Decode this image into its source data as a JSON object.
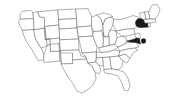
{
  "figure": {
    "width": 174,
    "height": 109,
    "background_color": "#ffffff",
    "outline_color": "#6e6e6e",
    "highlight_color": "#1a1a1a"
  },
  "chart_data": {
    "type": "map",
    "subtitle": "",
    "xlabel": "",
    "ylabel": "",
    "projection": "contiguous-48-states",
    "grid": false,
    "legend": "none",
    "base_fill": "#ffffff",
    "base_stroke": "#6e6e6e",
    "highlight_fill": "#1a1a1a",
    "regions": [
      {
        "code": "WA",
        "name": "Washington",
        "highlighted": false
      },
      {
        "code": "OR",
        "name": "Oregon",
        "highlighted": false
      },
      {
        "code": "CA",
        "name": "California",
        "highlighted": false
      },
      {
        "code": "NV",
        "name": "Nevada",
        "highlighted": false
      },
      {
        "code": "ID",
        "name": "Idaho",
        "highlighted": false
      },
      {
        "code": "MT",
        "name": "Montana",
        "highlighted": false
      },
      {
        "code": "WY",
        "name": "Wyoming",
        "highlighted": false
      },
      {
        "code": "UT",
        "name": "Utah",
        "highlighted": false
      },
      {
        "code": "AZ",
        "name": "Arizona",
        "highlighted": false
      },
      {
        "code": "CO",
        "name": "Colorado",
        "highlighted": false
      },
      {
        "code": "NM",
        "name": "New Mexico",
        "highlighted": false
      },
      {
        "code": "ND",
        "name": "North Dakota",
        "highlighted": false
      },
      {
        "code": "SD",
        "name": "South Dakota",
        "highlighted": false
      },
      {
        "code": "NE",
        "name": "Nebraska",
        "highlighted": false
      },
      {
        "code": "KS",
        "name": "Kansas",
        "highlighted": false
      },
      {
        "code": "OK",
        "name": "Oklahoma",
        "highlighted": false
      },
      {
        "code": "TX",
        "name": "Texas",
        "highlighted": false
      },
      {
        "code": "MN",
        "name": "Minnesota",
        "highlighted": false
      },
      {
        "code": "IA",
        "name": "Iowa",
        "highlighted": false
      },
      {
        "code": "MO",
        "name": "Missouri",
        "highlighted": false
      },
      {
        "code": "AR",
        "name": "Arkansas",
        "highlighted": false
      },
      {
        "code": "LA",
        "name": "Louisiana",
        "highlighted": false
      },
      {
        "code": "WI",
        "name": "Wisconsin",
        "highlighted": false
      },
      {
        "code": "IL",
        "name": "Illinois",
        "highlighted": false
      },
      {
        "code": "MI",
        "name": "Michigan",
        "highlighted": false
      },
      {
        "code": "IN",
        "name": "Indiana",
        "highlighted": false
      },
      {
        "code": "OH",
        "name": "Ohio",
        "highlighted": false
      },
      {
        "code": "KY",
        "name": "Kentucky",
        "highlighted": false
      },
      {
        "code": "TN",
        "name": "Tennessee",
        "highlighted": false
      },
      {
        "code": "MS",
        "name": "Mississippi",
        "highlighted": false
      },
      {
        "code": "AL",
        "name": "Alabama",
        "highlighted": false
      },
      {
        "code": "GA",
        "name": "Georgia",
        "highlighted": false
      },
      {
        "code": "FL",
        "name": "Florida",
        "highlighted": false
      },
      {
        "code": "SC",
        "name": "South Carolina",
        "highlighted": false
      },
      {
        "code": "NC",
        "name": "North Carolina",
        "highlighted": false
      },
      {
        "code": "VA",
        "name": "Virginia",
        "highlighted": false
      },
      {
        "code": "WV",
        "name": "West Virginia",
        "highlighted": false
      },
      {
        "code": "PA",
        "name": "Pennsylvania",
        "highlighted": false
      },
      {
        "code": "NY",
        "name": "New York",
        "highlighted": false
      },
      {
        "code": "VT",
        "name": "Vermont",
        "highlighted": false
      },
      {
        "code": "NH",
        "name": "New Hampshire",
        "highlighted": false
      },
      {
        "code": "ME",
        "name": "Maine",
        "highlighted": false
      },
      {
        "code": "MA",
        "name": "Massachusetts",
        "highlighted": false
      },
      {
        "code": "CT",
        "name": "Connecticut",
        "highlighted": true
      },
      {
        "code": "RI",
        "name": "Rhode Island",
        "highlighted": false
      },
      {
        "code": "NJ",
        "name": "New Jersey",
        "highlighted": false
      },
      {
        "code": "DE",
        "name": "Delaware",
        "highlighted": true
      },
      {
        "code": "MD",
        "name": "Maryland",
        "highlighted": true
      }
    ],
    "markers": [
      {
        "id": "marker-northeast",
        "label": "",
        "x": 140,
        "y": 23,
        "radius": 4.6,
        "color": "#1a1a1a"
      },
      {
        "id": "marker-mid-atlantic",
        "label": "",
        "x": 143.5,
        "y": 41,
        "radius": 2.4,
        "color": "#1a1a1a"
      }
    ]
  }
}
